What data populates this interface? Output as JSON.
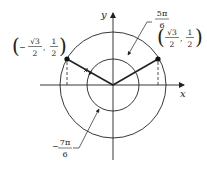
{
  "diagram": {
    "axes": {
      "x_label": "x",
      "y_label": "y"
    },
    "points": {
      "left": {
        "paren_open": "(",
        "minus": "−",
        "num1": "√3",
        "den1": "2",
        "comma": ",",
        "num2": "1",
        "den2": "2",
        "paren_close": ")"
      },
      "right": {
        "paren_open": "(",
        "num1": "√3",
        "den1": "2",
        "comma": ",",
        "num2": "1",
        "den2": "2",
        "paren_close": ")"
      }
    },
    "angles": {
      "positive": {
        "num": "5π",
        "den": "6"
      },
      "negative": {
        "minus": "−",
        "num": "7π",
        "den": "6"
      }
    },
    "colors": {
      "stroke": "#222222",
      "background": "#ffffff"
    }
  }
}
